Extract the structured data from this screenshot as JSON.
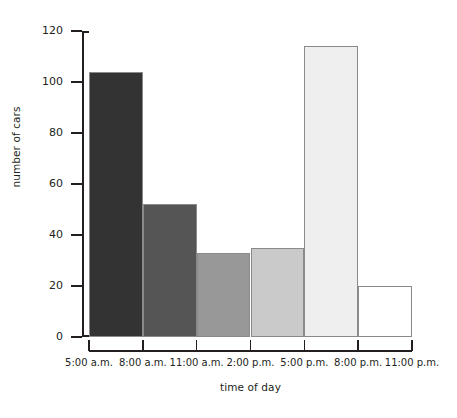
{
  "chart_data": {
    "type": "bar",
    "title": "",
    "xlabel": "time of day",
    "ylabel": "number of cars",
    "categories": [
      "5:00 a.m. - 8:00 a.m.",
      "8:00 a.m. - 11:00 a.m.",
      "11:00 a.m. - 2:00 p.m.",
      "2:00 p.m. - 5:00 p.m.",
      "5:00 p.m. - 8:00 p.m.",
      "8:00 p.m. - 11:00 p.m."
    ],
    "values": [
      104,
      52,
      33,
      35,
      114,
      20
    ],
    "bin_edges": [
      "5:00 a.m.",
      "8:00 a.m.",
      "11:00 a.m.",
      "2:00 p.m.",
      "5:00 p.m.",
      "8:00 p.m.",
      "11:00 p.m."
    ],
    "bar_colors": [
      "#333333",
      "#555555",
      "#989898",
      "#cacaca",
      "#efefef",
      "#ffffff"
    ],
    "ylim": [
      0,
      120
    ],
    "yticks": [
      0,
      20,
      40,
      60,
      80,
      100,
      120
    ],
    "ytick_labels": [
      "0",
      "20",
      "40",
      "60",
      "80",
      "100",
      "120"
    ],
    "grid": false,
    "legend": false
  }
}
